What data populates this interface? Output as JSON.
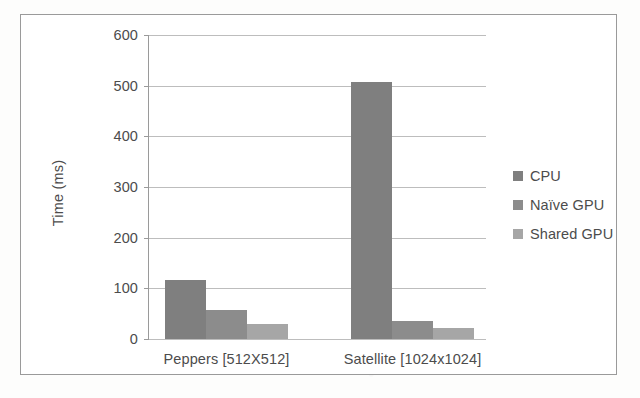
{
  "chart_data": {
    "type": "bar",
    "title": "",
    "xlabel": "",
    "ylabel": "Time (ms)",
    "ylim": [
      0,
      600
    ],
    "ytick_labels": [
      "0",
      "100",
      "200",
      "300",
      "400",
      "500",
      "600"
    ],
    "yticks": [
      0,
      100,
      200,
      300,
      400,
      500,
      600
    ],
    "grid": true,
    "legend_position": "right",
    "categories": [
      "Peppers [512X512]",
      "Satellite [1024x1024]"
    ],
    "series": [
      {
        "name": "CPU",
        "values": [
          117,
          508
        ],
        "color": "#7f7f7f"
      },
      {
        "name": "Naïve GPU",
        "values": [
          58,
          36
        ],
        "color": "#8c8c8c"
      },
      {
        "name": "Shared GPU",
        "values": [
          30,
          21
        ],
        "color": "#a6a6a6"
      }
    ]
  },
  "legend": {
    "items": [
      {
        "label": "CPU"
      },
      {
        "label": "Naïve GPU"
      },
      {
        "label": "Shared GPU"
      }
    ]
  }
}
